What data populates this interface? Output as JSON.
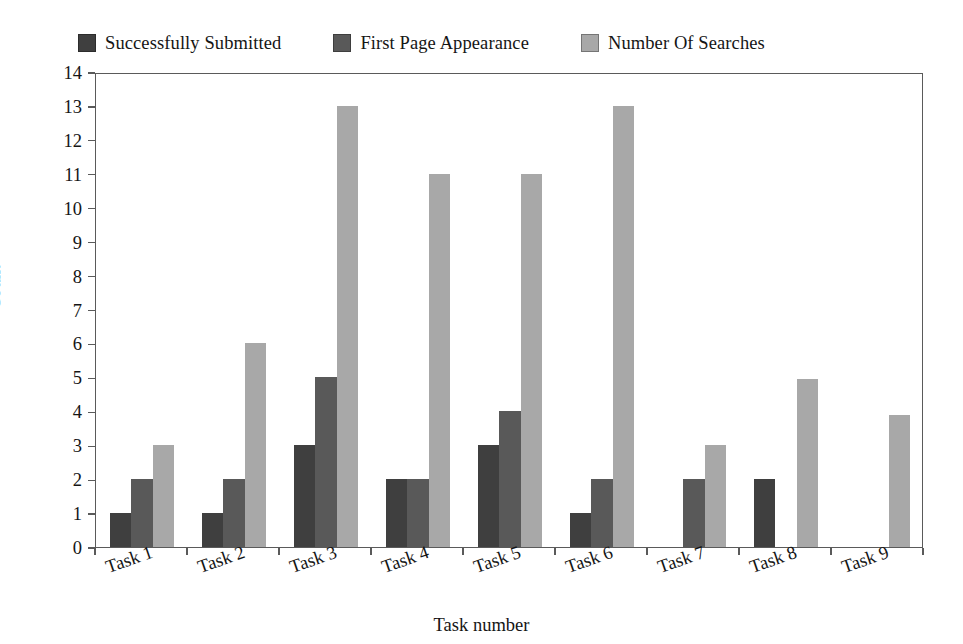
{
  "chart_data": {
    "type": "bar",
    "title": "",
    "xlabel": "Task number",
    "ylabel": "Count",
    "ylim": [
      0,
      14
    ],
    "ytick_labels": [
      "0",
      "1",
      "2",
      "3",
      "4",
      "5",
      "6",
      "7",
      "8",
      "9",
      "10",
      "11",
      "12",
      "13",
      "14"
    ],
    "grid": false,
    "legend_position": "top",
    "categories": [
      "Task 1",
      "Task 2",
      "Task 3",
      "Task 4",
      "Task 5",
      "Task 6",
      "Task 7",
      "Task 8",
      "Task 9"
    ],
    "series": [
      {
        "name": "Successfully Submitted",
        "color": "#3f3f3f",
        "values": [
          1,
          1,
          3,
          2,
          3,
          1,
          0,
          2,
          0
        ]
      },
      {
        "name": "First Page Appearance",
        "color": "#595959",
        "values": [
          2,
          2,
          5,
          2,
          4,
          2,
          2,
          0,
          0
        ]
      },
      {
        "name": "Number Of Searches",
        "color": "#a8a8a8",
        "values": [
          3,
          6,
          13,
          11,
          11,
          13,
          3,
          4.95,
          3.9
        ]
      }
    ]
  },
  "legend": {
    "entries": [
      {
        "label": "Successfully Submitted",
        "color": "#3f3f3f"
      },
      {
        "label": "First Page Appearance",
        "color": "#595959"
      },
      {
        "label": "Number Of Searches",
        "color": "#a8a8a8"
      }
    ]
  },
  "axes": {
    "y_title": "Count",
    "x_title": "Task number"
  },
  "colors": {
    "series_1": "#3f3f3f",
    "series_2": "#595959",
    "series_3": "#a8a8a8",
    "frame": "#5a5a5a",
    "text": "#151515",
    "background": "#ffffff"
  }
}
